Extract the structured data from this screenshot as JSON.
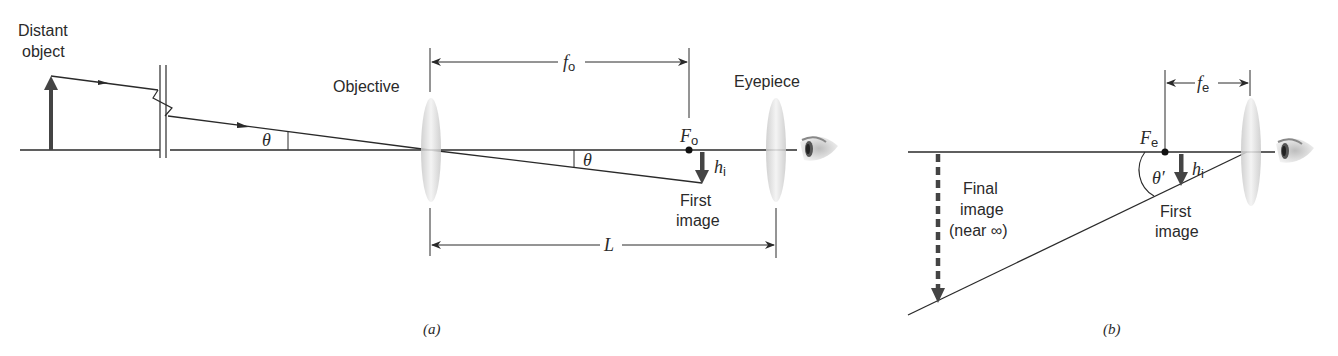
{
  "figure": {
    "panel_a": {
      "caption": "(a)",
      "labels": {
        "distant_object_line1": "Distant",
        "distant_object_line2": "object",
        "objective": "Objective",
        "eyepiece": "Eyepiece",
        "focal_point": "F",
        "focal_point_sub": "o",
        "focal_length": "f",
        "focal_length_sub": "o",
        "image_height": "h",
        "image_height_sub": "i",
        "angle_left": "θ",
        "angle_right": "θ",
        "first_image_line1": "First",
        "first_image_line2": "image",
        "length": "L"
      }
    },
    "panel_b": {
      "caption": "(b)",
      "labels": {
        "focal_point": "F",
        "focal_point_sub": "e",
        "focal_length": "f",
        "focal_length_sub": "e",
        "image_height": "h",
        "image_height_sub": "i",
        "angle": "θ′",
        "final_image_line1": "Final",
        "final_image_line2": "image",
        "final_image_line3": "(near ∞)",
        "first_image_line1": "First",
        "first_image_line2": "image"
      }
    },
    "colors": {
      "line": "#2a2a2a",
      "arrow": "#444444",
      "lens": "#d8d8d8"
    }
  }
}
